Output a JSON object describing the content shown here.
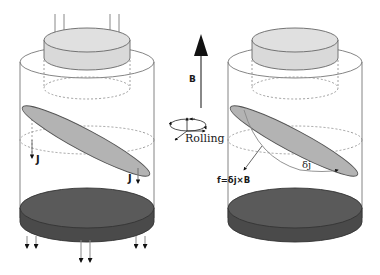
{
  "diagram": {
    "left_panel": {
      "current_label_left": "J",
      "current_label_right": "J"
    },
    "center": {
      "field_label": "B",
      "rotation_label": "Rolling"
    },
    "right_panel": {
      "perturbation_label": "δj",
      "force_label": "f=δj×B"
    },
    "colors": {
      "top_disk": "#d9d9d9",
      "tilted_disk": "#b3b3b3",
      "bottom_disk_top": "#555555",
      "bottom_disk_side": "#4a4a4a",
      "lines": "#777777",
      "dashed": "#888888",
      "arrow": "#111111",
      "field_arrow_shaft": "#888888"
    }
  }
}
